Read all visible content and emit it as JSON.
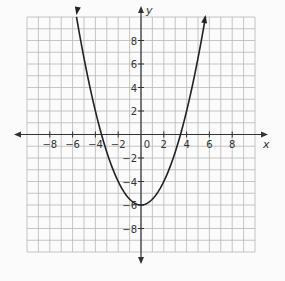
{
  "chart_data": {
    "type": "line",
    "title": "",
    "xlabel": "x",
    "ylabel": "y",
    "xlim": [
      -10,
      10
    ],
    "ylim": [
      -10,
      10
    ],
    "grid": true,
    "grid_step": 1,
    "x_ticks": [
      -8,
      -6,
      -4,
      -2,
      0,
      2,
      4,
      6,
      8
    ],
    "y_ticks": [
      -8,
      -6,
      -4,
      -2,
      2,
      4,
      6,
      8
    ],
    "x_tick_labels": [
      "−8",
      "−6",
      "−4",
      "−2",
      "0",
      "2",
      "4",
      "6",
      "8"
    ],
    "y_tick_labels": [
      "−8",
      "−6",
      "−4",
      "−2",
      "2",
      "4",
      "6",
      "8"
    ],
    "series": [
      {
        "name": "parabola",
        "equation": "y = 0.5x^2 - 6",
        "vertex": [
          0,
          -6
        ],
        "x_intercepts": [
          -3.46,
          3.46
        ],
        "x": [
          -5.66,
          -5,
          -4,
          -3.46,
          -3,
          -2,
          -1,
          0,
          1,
          2,
          3,
          3.46,
          4,
          5,
          5.66
        ],
        "y": [
          10,
          6.5,
          2,
          0,
          -1.5,
          -4,
          -5.5,
          -6,
          -5.5,
          -4,
          -1.5,
          0,
          2,
          6.5,
          10
        ],
        "arrows_at_ends": true
      }
    ]
  }
}
